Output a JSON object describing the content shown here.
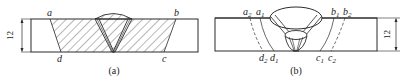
{
  "figure": {
    "panels": [
      {
        "id": "a",
        "caption": "(a)",
        "dimension_label": "12",
        "point_labels": {
          "top_left": "a",
          "top_right": "b",
          "bottom_left": "d",
          "bottom_right": "c"
        }
      },
      {
        "id": "b",
        "caption": "(b)",
        "dimension_label": "12",
        "point_labels": {
          "a2": "a",
          "a2_sub": "2",
          "a1": "a",
          "a1_sub": "1",
          "b1": "b",
          "b1_sub": "1",
          "b2": "b",
          "b2_sub": "2",
          "d2": "d",
          "d2_sub": "2",
          "d1": "d",
          "d1_sub": "1",
          "c1": "c",
          "c1_sub": "1",
          "c2": "c",
          "c2_sub": "2"
        }
      }
    ],
    "colors": {
      "line": "#2a2a2a",
      "background": "#ffffff"
    }
  }
}
